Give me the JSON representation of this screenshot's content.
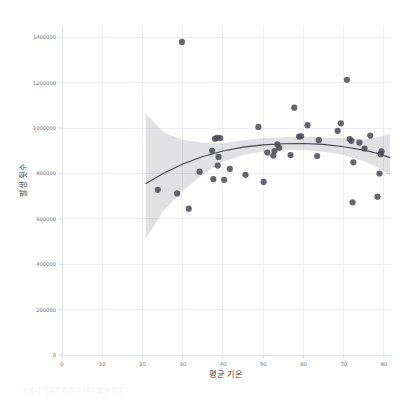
{
  "figure": {
    "background_color": "#ffffff",
    "plot_background_color": "#ffffff",
    "grid_color": "#e6e6ee",
    "point_color": "#4c4c55",
    "line_color": "#45454f",
    "band_color": "#5a5a64",
    "clipped_caption": "서울시 기온과 따릉이 대여 발생 횟수"
  },
  "chart_data": {
    "type": "scatter",
    "title": "",
    "subtitle": "",
    "xlabel": "평균 기온",
    "ylabel": "발생 횟수",
    "xlim": [
      0,
      82
    ],
    "ylim": [
      0,
      1450000
    ],
    "xticks": [
      0,
      10,
      20,
      30,
      40,
      50,
      60,
      70,
      80
    ],
    "xtick_labels": [
      "0",
      "10",
      "20",
      "30",
      "40",
      "50",
      "60",
      "70",
      "80"
    ],
    "yticks": [
      0,
      200000,
      400000,
      600000,
      800000,
      1000000,
      1200000,
      1400000
    ],
    "ytick_labels": [
      "0",
      "200000",
      "400000",
      "600000",
      "800000",
      "1000000",
      "1200000",
      "1400000"
    ],
    "grid": true,
    "grid_axis": "both",
    "legend": false,
    "legend_position": "none",
    "marker": "circle",
    "marker_size": 3.1,
    "regression": {
      "type": "polynomial",
      "order": 2,
      "ci": 95,
      "band_shown": true,
      "x_range": [
        20.8,
        81.5
      ]
    },
    "points": [
      {
        "x": 23.8,
        "y": 728000
      },
      {
        "x": 28.6,
        "y": 712000
      },
      {
        "x": 29.8,
        "y": 1380000
      },
      {
        "x": 31.5,
        "y": 645000
      },
      {
        "x": 34.2,
        "y": 808000
      },
      {
        "x": 37.3,
        "y": 900000
      },
      {
        "x": 37.6,
        "y": 775000
      },
      {
        "x": 38.0,
        "y": 953000
      },
      {
        "x": 38.5,
        "y": 957000
      },
      {
        "x": 38.7,
        "y": 835000
      },
      {
        "x": 38.9,
        "y": 873000
      },
      {
        "x": 39.3,
        "y": 956000
      },
      {
        "x": 40.3,
        "y": 772000
      },
      {
        "x": 41.7,
        "y": 820000
      },
      {
        "x": 45.6,
        "y": 794000
      },
      {
        "x": 48.8,
        "y": 1005000
      },
      {
        "x": 50.1,
        "y": 763000
      },
      {
        "x": 51.0,
        "y": 892000
      },
      {
        "x": 52.5,
        "y": 879000
      },
      {
        "x": 52.8,
        "y": 899000
      },
      {
        "x": 53.5,
        "y": 928000
      },
      {
        "x": 54.0,
        "y": 913000
      },
      {
        "x": 56.8,
        "y": 881000
      },
      {
        "x": 57.7,
        "y": 1090000
      },
      {
        "x": 58.9,
        "y": 963000
      },
      {
        "x": 59.4,
        "y": 964000
      },
      {
        "x": 61.0,
        "y": 1013000
      },
      {
        "x": 63.4,
        "y": 877000
      },
      {
        "x": 63.8,
        "y": 947000
      },
      {
        "x": 68.5,
        "y": 988000
      },
      {
        "x": 69.3,
        "y": 1021000
      },
      {
        "x": 70.8,
        "y": 1213000
      },
      {
        "x": 71.5,
        "y": 952000
      },
      {
        "x": 71.9,
        "y": 944000
      },
      {
        "x": 72.2,
        "y": 673000
      },
      {
        "x": 72.4,
        "y": 849000
      },
      {
        "x": 73.9,
        "y": 936000
      },
      {
        "x": 75.2,
        "y": 910000
      },
      {
        "x": 76.6,
        "y": 967000
      },
      {
        "x": 78.4,
        "y": 698000
      },
      {
        "x": 78.9,
        "y": 800000
      },
      {
        "x": 79.2,
        "y": 885000
      },
      {
        "x": 79.4,
        "y": 897000
      }
    ],
    "fit_curve": [
      {
        "x": 20.8,
        "y": 755000
      },
      {
        "x": 25.0,
        "y": 799000
      },
      {
        "x": 30.0,
        "y": 842000
      },
      {
        "x": 35.0,
        "y": 875000
      },
      {
        "x": 40.0,
        "y": 899000
      },
      {
        "x": 45.0,
        "y": 916000
      },
      {
        "x": 50.0,
        "y": 926000
      },
      {
        "x": 55.0,
        "y": 931000
      },
      {
        "x": 60.0,
        "y": 932000
      },
      {
        "x": 65.0,
        "y": 928000
      },
      {
        "x": 70.0,
        "y": 918000
      },
      {
        "x": 75.0,
        "y": 903000
      },
      {
        "x": 78.0,
        "y": 890000
      },
      {
        "x": 81.5,
        "y": 870000
      }
    ],
    "ci_upper": [
      {
        "x": 20.8,
        "y": 1065000
      },
      {
        "x": 25.0,
        "y": 985000
      },
      {
        "x": 30.0,
        "y": 948000
      },
      {
        "x": 35.0,
        "y": 935000
      },
      {
        "x": 40.0,
        "y": 933000
      },
      {
        "x": 45.0,
        "y": 946000
      },
      {
        "x": 50.0,
        "y": 955000
      },
      {
        "x": 55.0,
        "y": 960000
      },
      {
        "x": 60.0,
        "y": 962000
      },
      {
        "x": 65.0,
        "y": 960000
      },
      {
        "x": 70.0,
        "y": 955000
      },
      {
        "x": 75.0,
        "y": 952000
      },
      {
        "x": 78.0,
        "y": 958000
      },
      {
        "x": 81.5,
        "y": 975000
      }
    ],
    "ci_lower": [
      {
        "x": 20.8,
        "y": 512000
      },
      {
        "x": 25.0,
        "y": 630000
      },
      {
        "x": 30.0,
        "y": 724000
      },
      {
        "x": 35.0,
        "y": 795000
      },
      {
        "x": 40.0,
        "y": 852000
      },
      {
        "x": 45.0,
        "y": 882000
      },
      {
        "x": 50.0,
        "y": 897000
      },
      {
        "x": 55.0,
        "y": 903000
      },
      {
        "x": 60.0,
        "y": 903000
      },
      {
        "x": 65.0,
        "y": 896000
      },
      {
        "x": 70.0,
        "y": 881000
      },
      {
        "x": 75.0,
        "y": 854000
      },
      {
        "x": 78.0,
        "y": 830000
      },
      {
        "x": 81.5,
        "y": 790000
      }
    ]
  }
}
